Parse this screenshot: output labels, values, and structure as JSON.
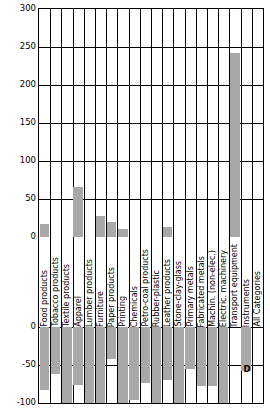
{
  "chart_data": {
    "type": "bar",
    "title": "",
    "subtitle": "",
    "xlabel": "",
    "ylabel": "",
    "ylim": [
      -100,
      300
    ],
    "yticks": [
      300,
      250,
      200,
      150,
      100,
      50,
      0,
      0,
      -50,
      -100
    ],
    "ytick_labels": [
      "300",
      "250",
      "200",
      "150",
      "100",
      "50",
      "0",
      "0",
      "-50",
      "-100"
    ],
    "grid": true,
    "legend": null,
    "bar_color": "#a8a8a8",
    "categories": [
      "Food products",
      "Tobacco products",
      "Textile products",
      "Apparel",
      "Lumber products",
      "Furniture",
      "Paper products",
      "Printing",
      "Chemicals",
      "Petro-coal products",
      "Rubber-plastic",
      "Leather products",
      "Stone-clay-glass",
      "Primary metals",
      "Fabricated metals",
      "Machin. (non-elec.)",
      "Electric. machinery",
      "Transport equipment",
      "Instruments",
      "All Categories"
    ],
    "positive_values": [
      17,
      0,
      0,
      66,
      0,
      27,
      20,
      11,
      0,
      0,
      0,
      13,
      0,
      0,
      0,
      0,
      0,
      242,
      0,
      0
    ],
    "negative_values": [
      -83,
      -62,
      -100,
      -76,
      -100,
      -100,
      -42,
      -100,
      -96,
      -74,
      -100,
      -70,
      -100,
      -55,
      -78,
      -78,
      -100,
      0,
      -58,
      0
    ],
    "annotations": [
      {
        "text": "D",
        "category": "Instruments",
        "value": -57
      }
    ]
  }
}
